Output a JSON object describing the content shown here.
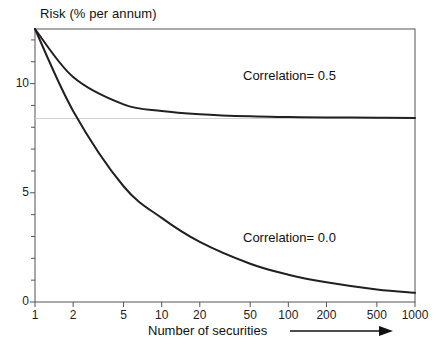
{
  "chart_data": {
    "type": "line",
    "title": "Risk (% per annum)",
    "xlabel": "Number of securities",
    "ylabel": "Risk (% per annum)",
    "xscale": "log",
    "xlim": [
      1,
      1000
    ],
    "ylim": [
      0,
      12.5
    ],
    "grid": false,
    "gridline_y": 8.4,
    "legend_position": "inside-right",
    "x_tick_labels": [
      "1",
      "2",
      "5",
      "10",
      "20",
      "50",
      "100",
      "200",
      "500",
      "1000"
    ],
    "x_ticks": [
      1,
      2,
      5,
      10,
      20,
      50,
      100,
      200,
      500,
      1000
    ],
    "y_tick_labels": [
      "0",
      "5",
      "10"
    ],
    "y_ticks": [
      0,
      5,
      10
    ],
    "y_minor_ticks": [
      1,
      2,
      3,
      4,
      6,
      7,
      8,
      9,
      11,
      12
    ],
    "x": [
      1,
      2,
      5,
      10,
      20,
      50,
      100,
      200,
      500,
      1000
    ],
    "series": [
      {
        "name": "Correlation= 0.5",
        "label": "Correlation= 0.5",
        "color": "#231f20",
        "values": [
          12.5,
          10.3,
          9.05,
          8.75,
          8.6,
          8.5,
          8.47,
          8.45,
          8.44,
          8.43
        ]
      },
      {
        "name": "Correlation= 0.0",
        "label": "Correlation= 0.0",
        "color": "#231f20",
        "values": [
          12.5,
          8.75,
          5.3,
          3.85,
          2.75,
          1.75,
          1.25,
          0.9,
          0.57,
          0.42
        ]
      }
    ],
    "annotations": [
      {
        "name": "x-axis-arrow",
        "text": "→",
        "meaning": "increasing number of securities"
      }
    ]
  },
  "axis": {
    "frame_color": "#555555",
    "tick_color": "#555555",
    "curve_color": "#231f20",
    "gridline_color": "#cfcfcf"
  }
}
